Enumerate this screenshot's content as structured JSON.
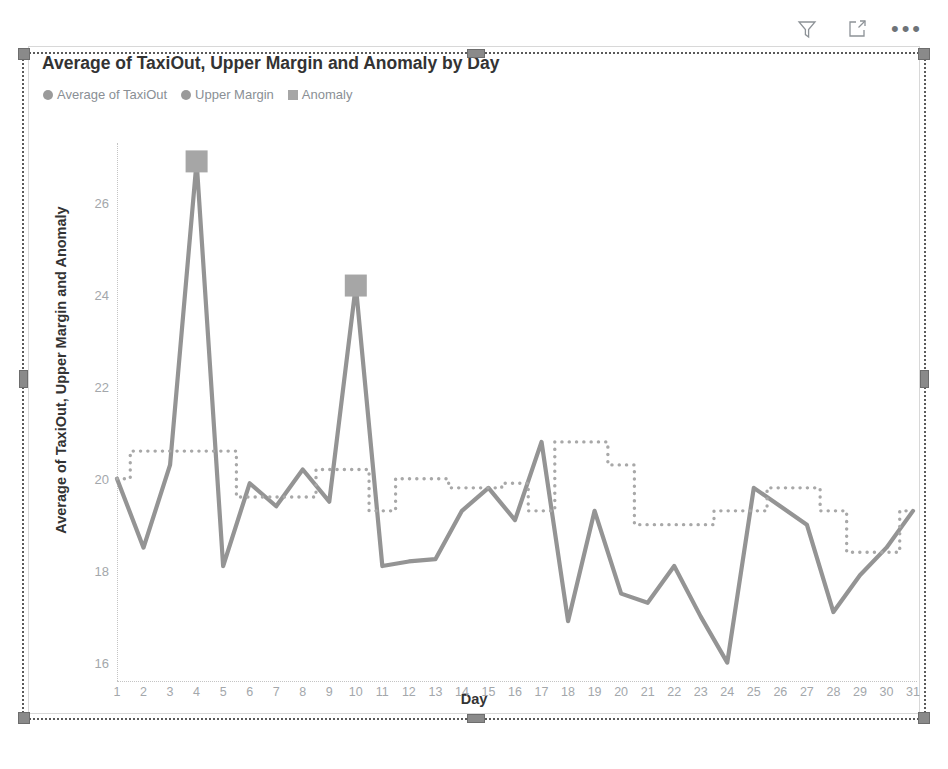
{
  "visual": {
    "header": {
      "filter_icon": "filter-funnel-icon",
      "focus_icon": "focus-mode-icon",
      "more_label": "•••",
      "more_icon": "more-options-icon"
    },
    "title": "Average of TaxiOut, Upper Margin and Anomaly by Day",
    "legend": [
      {
        "label": "Average of TaxiOut",
        "marker": "circle",
        "color": "#9a9a9a"
      },
      {
        "label": "Upper Margin",
        "marker": "circle",
        "color": "#9a9a9a"
      },
      {
        "label": "Anomaly",
        "marker": "square",
        "color": "#a6a6a6"
      }
    ],
    "selected": true
  },
  "chart_data": {
    "type": "line",
    "title": "Average of TaxiOut, Upper Margin and Anomaly by Day",
    "xlabel": "Day",
    "ylabel": "Average of TaxiOut, Upper Margin and Anomaly",
    "xlim": [
      1,
      31
    ],
    "ylim": [
      15.6,
      27.3
    ],
    "yticks": [
      16,
      18,
      20,
      22,
      24,
      26
    ],
    "grid": false,
    "legend_position": "top-left",
    "categories": [
      1,
      2,
      3,
      4,
      5,
      6,
      7,
      8,
      9,
      10,
      11,
      12,
      13,
      14,
      15,
      16,
      17,
      18,
      19,
      20,
      21,
      22,
      23,
      24,
      25,
      26,
      27,
      28,
      29,
      30,
      31
    ],
    "series": [
      {
        "name": "Average of TaxiOut",
        "style": "solid",
        "color": "#949494",
        "values": [
          20.0,
          18.5,
          20.3,
          26.9,
          18.1,
          19.9,
          19.4,
          20.2,
          19.5,
          24.2,
          18.1,
          18.2,
          18.25,
          19.3,
          19.8,
          19.1,
          20.8,
          16.9,
          19.3,
          17.5,
          17.3,
          18.1,
          17.0,
          16.0,
          19.8,
          19.4,
          19.0,
          17.1,
          17.9,
          18.5,
          19.3
        ]
      },
      {
        "name": "Upper Margin",
        "style": "dotted-step",
        "color": "#a8a8a8",
        "values": [
          20.0,
          20.6,
          20.6,
          20.6,
          20.6,
          19.6,
          19.6,
          19.6,
          20.2,
          20.2,
          19.3,
          20.0,
          20.0,
          19.8,
          19.8,
          19.9,
          19.3,
          20.8,
          20.8,
          20.3,
          19.0,
          19.0,
          19.0,
          19.3,
          19.3,
          19.8,
          19.8,
          19.3,
          18.4,
          18.4,
          19.3
        ]
      },
      {
        "name": "Anomaly",
        "style": "square-marker",
        "color": "#a6a6a6",
        "points": [
          {
            "day": 4,
            "value": 26.9
          },
          {
            "day": 10,
            "value": 24.2
          }
        ]
      }
    ]
  }
}
